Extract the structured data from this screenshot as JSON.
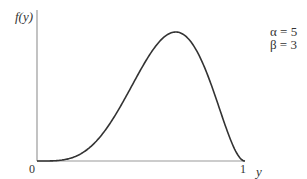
{
  "chart_data": {
    "type": "line",
    "title": "",
    "xlabel": "y",
    "ylabel": "f(y)",
    "xlim": [
      0,
      1
    ],
    "x_ticks": [
      "0",
      "1"
    ],
    "grid": false,
    "legend_position": "top-right",
    "annotations": [
      "α = 5",
      "β = 3"
    ],
    "distribution": "Beta",
    "parameters": {
      "alpha": 5,
      "beta": 3
    },
    "series": [
      {
        "name": "f(y)",
        "x": [
          0,
          0.1,
          0.2,
          0.3,
          0.4,
          0.5,
          0.6,
          0.667,
          0.7,
          0.8,
          0.9,
          1.0
        ],
        "values": [
          0,
          0.0057,
          0.1147,
          0.5294,
          1.2902,
          2.1875,
          2.903,
          3.0726,
          3.0253,
          2.2938,
          0.9185,
          0
        ]
      }
    ]
  },
  "labels": {
    "ylabel": "f(y)",
    "xlabel": "y",
    "tick0": "0",
    "tick1": "1",
    "alpha": "α = 5",
    "beta": "β = 3"
  },
  "colors": {
    "axis": "#9a9a9a",
    "curve": "#333333"
  }
}
